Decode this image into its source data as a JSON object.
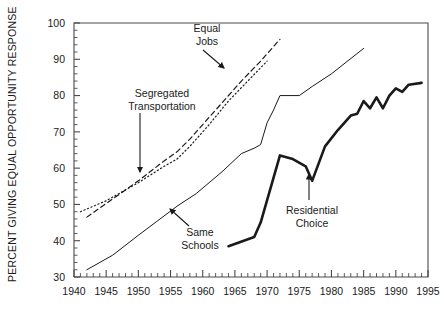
{
  "chart_data": {
    "type": "line",
    "title": "",
    "xlabel": "",
    "ylabel": "PERCENT GIVING EQUAL OPPORTUNITY RESPONSE",
    "xlim": [
      1940,
      1995
    ],
    "ylim": [
      30,
      100
    ],
    "grid": false,
    "legend": "annotations-on-plot",
    "x_ticks": [
      1940,
      1945,
      1950,
      1955,
      1960,
      1965,
      1970,
      1975,
      1980,
      1985,
      1990,
      1995
    ],
    "x_tick_labels": [
      "1940",
      "1945",
      "1950",
      "1955",
      "1960",
      "1965",
      "1970",
      "1975",
      "1980",
      "1985",
      "1990",
      "1995"
    ],
    "x_minor_step": 1,
    "y_ticks": [
      30,
      40,
      50,
      60,
      70,
      80,
      90,
      100
    ],
    "y_tick_labels": [
      "30",
      "40",
      "50",
      "60",
      "70",
      "80",
      "90",
      "100"
    ],
    "y_minor_step": 2,
    "series": [
      {
        "name": "Equal Jobs",
        "style": "dashed",
        "color": "#1a1a1a",
        "width": 1.2,
        "points": [
          [
            1942,
            46.5
          ],
          [
            1946,
            51.5
          ],
          [
            1950,
            56.5
          ],
          [
            1954,
            62.0
          ],
          [
            1956,
            64.5
          ],
          [
            1958,
            68.0
          ],
          [
            1963,
            78.0
          ],
          [
            1966,
            84.0
          ],
          [
            1969,
            89.5
          ],
          [
            1972,
            95.5
          ]
        ]
      },
      {
        "name": "Segregated Transportation",
        "style": "dotted",
        "color": "#1a1a1a",
        "width": 1.2,
        "points": [
          [
            1941,
            48.0
          ],
          [
            1945,
            51.0
          ],
          [
            1950,
            56.0
          ],
          [
            1954,
            60.5
          ],
          [
            1956,
            62.5
          ],
          [
            1958,
            66.0
          ],
          [
            1961,
            72.0
          ],
          [
            1964,
            78.5
          ],
          [
            1967,
            84.0
          ],
          [
            1970,
            89.5
          ]
        ]
      },
      {
        "name": "Same Schools",
        "style": "solid-thin",
        "color": "#1a1a1a",
        "width": 1.0,
        "points": [
          [
            1942,
            32.0
          ],
          [
            1946,
            36.0
          ],
          [
            1950,
            41.5
          ],
          [
            1953,
            45.5
          ],
          [
            1956,
            49.5
          ],
          [
            1959,
            53.0
          ],
          [
            1963,
            59.0
          ],
          [
            1966,
            64.0
          ],
          [
            1968,
            65.5
          ],
          [
            1969,
            66.5
          ],
          [
            1970,
            72.5
          ],
          [
            1971,
            76.0
          ],
          [
            1972,
            80.0
          ],
          [
            1975,
            80.0
          ],
          [
            1977,
            82.5
          ],
          [
            1980,
            86.0
          ],
          [
            1985,
            93.0
          ]
        ]
      },
      {
        "name": "Residential Choice",
        "style": "solid-thick",
        "color": "#1a1a1a",
        "width": 2.6,
        "points": [
          [
            1964,
            38.5
          ],
          [
            1968,
            41.0
          ],
          [
            1969,
            45.0
          ],
          [
            1972,
            63.5
          ],
          [
            1974,
            62.5
          ],
          [
            1976,
            60.5
          ],
          [
            1977,
            56.5
          ],
          [
            1979,
            66.0
          ],
          [
            1981,
            70.5
          ],
          [
            1983,
            74.5
          ],
          [
            1984,
            75.0
          ],
          [
            1985,
            78.5
          ],
          [
            1986,
            76.5
          ],
          [
            1987,
            79.5
          ],
          [
            1988,
            76.5
          ],
          [
            1989,
            80.0
          ],
          [
            1990,
            82.0
          ],
          [
            1991,
            81.0
          ],
          [
            1992,
            83.0
          ],
          [
            1994,
            83.5
          ]
        ]
      }
    ],
    "annotations": [
      {
        "name": "equal-jobs",
        "lines": [
          "Equal",
          "Jobs"
        ],
        "text_x": 207,
        "text_y": 32,
        "align": "middle",
        "arrow": {
          "x1": 203,
          "y1": 50,
          "x2": 224,
          "y2": 68
        }
      },
      {
        "name": "segregated-transportation",
        "lines": [
          "Segregated",
          "Transportation"
        ],
        "text_x": 162,
        "text_y": 97,
        "align": "middle",
        "arrow": {
          "x1": 140,
          "y1": 113,
          "x2": 140,
          "y2": 172
        }
      },
      {
        "name": "same-schools",
        "lines": [
          "Same",
          "Schools"
        ],
        "text_x": 200,
        "text_y": 236,
        "align": "middle",
        "arrow": {
          "x1": 189,
          "y1": 226,
          "x2": 170,
          "y2": 209
        }
      },
      {
        "name": "residential-choice",
        "lines": [
          "Residential",
          "Choice"
        ],
        "text_x": 312,
        "text_y": 214,
        "align": "middle",
        "arrow": {
          "x1": 309,
          "y1": 200,
          "x2": 309,
          "y2": 174
        }
      }
    ]
  },
  "axes": {
    "y_label": "PERCENT GIVING EQUAL OPPORTUNITY RESPONSE"
  }
}
